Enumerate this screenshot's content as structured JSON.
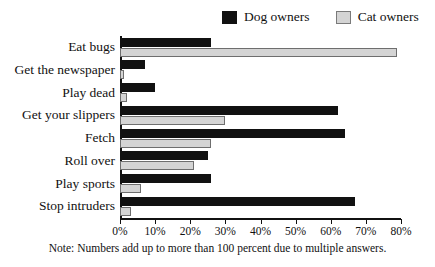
{
  "chart_data": {
    "type": "bar",
    "orientation": "horizontal",
    "title": "",
    "subtitle": "",
    "xlabel": "",
    "ylabel": "",
    "xlim": [
      0,
      80
    ],
    "xtick_labels": [
      "0%",
      "10%",
      "20%",
      "30%",
      "40%",
      "50%",
      "60%",
      "70%",
      "80%"
    ],
    "xticks": [
      0,
      10,
      20,
      30,
      40,
      50,
      60,
      70,
      80
    ],
    "grid": false,
    "legend_position": "top-right",
    "categories": [
      "Eat bugs",
      "Get the newspaper",
      "Play dead",
      "Get your slippers",
      "Fetch",
      "Roll over",
      "Play sports",
      "Stop intruders"
    ],
    "series": [
      {
        "name": "Dog owners",
        "color": "#111111",
        "values": [
          26,
          7,
          10,
          62,
          64,
          25,
          26,
          67
        ]
      },
      {
        "name": "Cat owners",
        "color": "#d4d4d4",
        "values": [
          79,
          1,
          2,
          30,
          26,
          21,
          6,
          3
        ]
      }
    ],
    "annotations": [
      "Note: Numbers add up to more than 100 percent due to multiple answers."
    ]
  },
  "legend": {
    "entries": [
      {
        "label": "Dog owners",
        "swatch": "black-square-icon"
      },
      {
        "label": "Cat owners",
        "swatch": "gray-square-icon"
      }
    ]
  },
  "footnote": {
    "text": "Note: Numbers add up to more than 100 percent due to multiple answers."
  }
}
